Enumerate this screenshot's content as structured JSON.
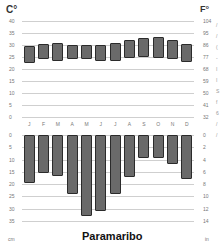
{
  "chart_data": [
    {
      "type": "bar",
      "subtype": "floating-range",
      "title": "Paramaribo",
      "ylabel_left": "C°",
      "ylabel_right": "F°",
      "categories": [
        "J",
        "F",
        "M",
        "A",
        "M",
        "J",
        "J",
        "A",
        "S",
        "O",
        "N",
        "D"
      ],
      "series": [
        {
          "name": "Min temperature (°C)",
          "values": [
            22.5,
            24,
            23.5,
            24,
            24,
            23.5,
            23.5,
            24.5,
            25,
            24.5,
            24,
            23
          ]
        },
        {
          "name": "Max temperature (°C)",
          "values": [
            29.5,
            30.5,
            31,
            30,
            30,
            30,
            31,
            32,
            33,
            33.5,
            32,
            30.5
          ]
        }
      ],
      "ylim": [
        0,
        40
      ],
      "yticks_left": [
        0,
        5,
        10,
        15,
        20,
        25,
        30,
        35,
        40
      ],
      "yticks_right": [
        32,
        41,
        50,
        59,
        68,
        77,
        86,
        95,
        104
      ],
      "grid": true
    },
    {
      "type": "bar",
      "title": "Paramaribo",
      "ylabel_left": "cm",
      "ylabel_right": "in",
      "categories": [
        "J",
        "F",
        "M",
        "A",
        "M",
        "J",
        "J",
        "A",
        "S",
        "O",
        "N",
        "D"
      ],
      "series": [
        {
          "name": "Precipitation (cm)",
          "values": [
            19.5,
            15.5,
            16.5,
            24,
            33,
            31,
            24,
            17,
            9.5,
            9.5,
            12,
            18
          ]
        }
      ],
      "ylim": [
        0,
        35
      ],
      "inverted": true,
      "yticks_left": [
        0,
        5,
        10,
        15,
        20,
        25,
        30,
        35
      ],
      "yticks_right": [
        0,
        2,
        4,
        6,
        8,
        10,
        12,
        14
      ],
      "grid": true
    }
  ],
  "labels": {
    "unit_c": "C°",
    "unit_f": "F°",
    "unit_cm": "cm",
    "unit_in": "in",
    "city": "Paramaribo"
  }
}
